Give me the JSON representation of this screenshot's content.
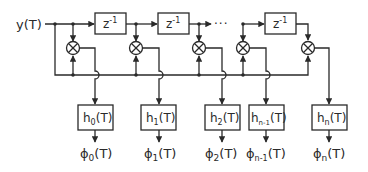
{
  "diagram": {
    "title": "",
    "input": {
      "label": "y(T)"
    },
    "delays": [
      {
        "label": "z",
        "exp": "-1"
      },
      {
        "label": "z",
        "exp": "-1"
      },
      {
        "label": "z",
        "exp": "-1"
      }
    ],
    "ellipsis": "···",
    "multiplier_icon": "circle-cross-multiplier",
    "filters": [
      {
        "base": "h",
        "sub": "0",
        "arg": "(T)"
      },
      {
        "base": "h",
        "sub": "1",
        "arg": "(T)"
      },
      {
        "base": "h",
        "sub": "2",
        "arg": "(T)"
      },
      {
        "base": "h",
        "sub": "n-1",
        "arg": "(T)"
      },
      {
        "base": "h",
        "sub": "n",
        "arg": "(T)"
      }
    ],
    "outputs": [
      {
        "base": "ϕ",
        "sub": "0",
        "arg": "(T)"
      },
      {
        "base": "ϕ",
        "sub": "1",
        "arg": "(T)"
      },
      {
        "base": "ϕ",
        "sub": "2",
        "arg": "(T)"
      },
      {
        "base": "ϕ",
        "sub": "n-1",
        "arg": "(T)"
      },
      {
        "base": "ϕ",
        "sub": "n",
        "arg": "(T)"
      }
    ]
  }
}
